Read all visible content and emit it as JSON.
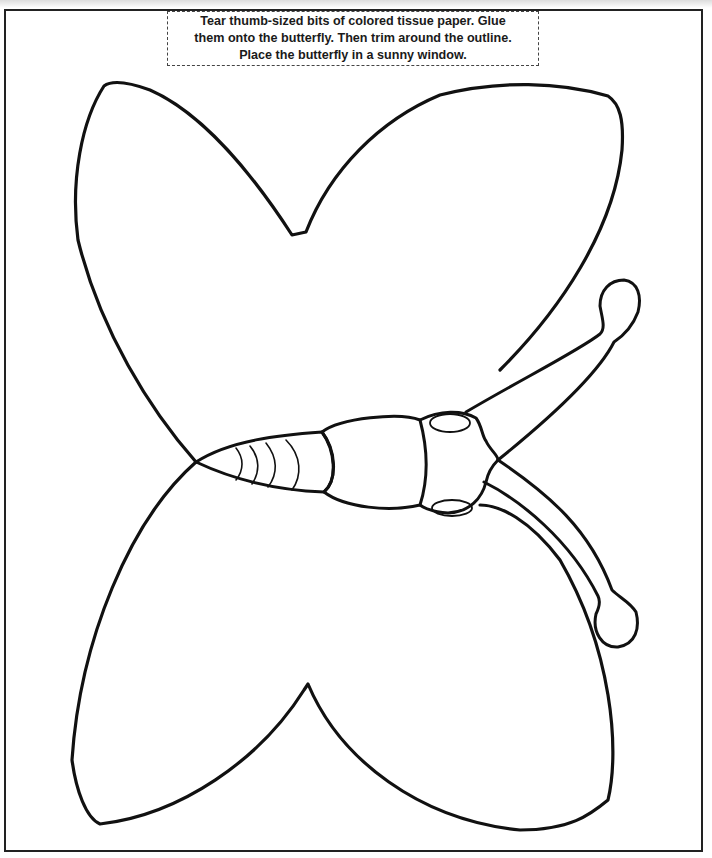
{
  "worksheet": {
    "instructions": {
      "line1": "Tear thumb-sized bits of colored tissue paper. Glue",
      "line2": "them onto the butterfly. Then trim around the outline.",
      "line3": "Place the butterfly in a sunny window."
    },
    "illustration": {
      "subject": "butterfly-outline",
      "parts": [
        "upper-left-wing",
        "upper-right-wing",
        "lower-left-wing",
        "lower-right-wing",
        "abdomen",
        "thorax",
        "head",
        "upper-antenna",
        "lower-antenna"
      ]
    },
    "colors": {
      "line": "#111111",
      "background": "#ffffff",
      "border": "#222222"
    }
  }
}
